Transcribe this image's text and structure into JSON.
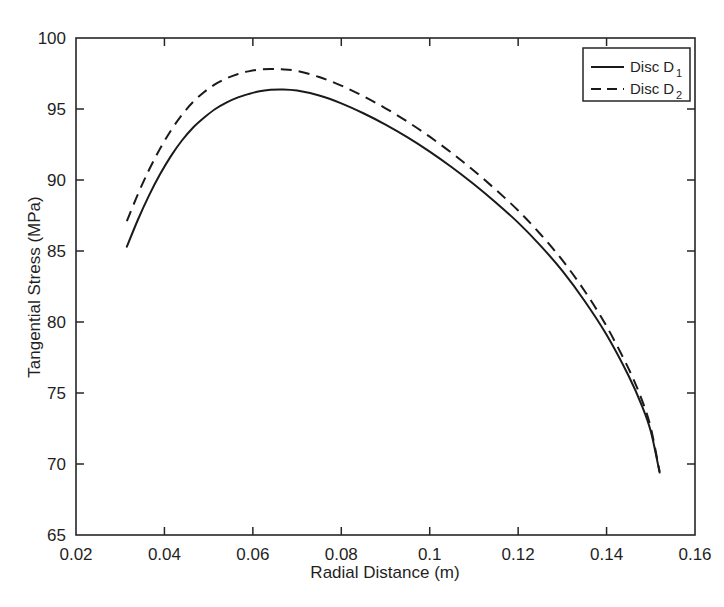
{
  "chart_data": {
    "type": "line",
    "title": "",
    "xlabel": "Radial Distance (m)",
    "ylabel": "Tangential Stress (MPa)",
    "xlim": [
      0.02,
      0.16
    ],
    "ylim": [
      65,
      100
    ],
    "xticks": [
      "0.02",
      "0.04",
      "0.06",
      "0.08",
      "0.1",
      "0.12",
      "0.14",
      "0.16"
    ],
    "xtick_values": [
      0.02,
      0.04,
      0.06,
      0.08,
      0.1,
      0.12,
      0.14,
      0.16
    ],
    "yticks": [
      "65",
      "70",
      "75",
      "80",
      "85",
      "90",
      "95",
      "100"
    ],
    "ytick_values": [
      65,
      70,
      75,
      80,
      85,
      90,
      95,
      100
    ],
    "grid": false,
    "legend_position": "top-right",
    "series": [
      {
        "name": "Disc D1",
        "label_base": "Disc D",
        "label_sub": "1",
        "style": "solid",
        "color": "#1a1a1a",
        "x": [
          0.0315,
          0.034,
          0.0365,
          0.039,
          0.0415,
          0.044,
          0.0465,
          0.049,
          0.0515,
          0.054,
          0.0565,
          0.059,
          0.0615,
          0.064,
          0.0665,
          0.07,
          0.075,
          0.08,
          0.085,
          0.09,
          0.095,
          0.1,
          0.105,
          0.11,
          0.115,
          0.12,
          0.125,
          0.13,
          0.135,
          0.14,
          0.145,
          0.148,
          0.15,
          0.152
        ],
        "y": [
          85.3,
          87.2,
          88.9,
          90.4,
          91.7,
          92.8,
          93.7,
          94.4,
          95.0,
          95.45,
          95.8,
          96.05,
          96.25,
          96.35,
          96.38,
          96.3,
          95.95,
          95.4,
          94.7,
          93.9,
          93.0,
          92.0,
          90.9,
          89.7,
          88.4,
          87.0,
          85.4,
          83.6,
          81.5,
          79.1,
          76.2,
          74.1,
          72.3,
          69.4
        ]
      },
      {
        "name": "Disc D2",
        "label_base": "Disc D",
        "label_sub": "2",
        "style": "dashed",
        "color": "#1a1a1a",
        "x": [
          0.0315,
          0.034,
          0.0365,
          0.039,
          0.0415,
          0.044,
          0.0465,
          0.049,
          0.0515,
          0.054,
          0.0565,
          0.059,
          0.0615,
          0.064,
          0.0665,
          0.07,
          0.075,
          0.08,
          0.085,
          0.09,
          0.095,
          0.1,
          0.105,
          0.11,
          0.115,
          0.12,
          0.125,
          0.13,
          0.135,
          0.14,
          0.145,
          0.148,
          0.15,
          0.152
        ],
        "y": [
          87.1,
          89.0,
          90.7,
          92.2,
          93.5,
          94.6,
          95.5,
          96.2,
          96.75,
          97.15,
          97.45,
          97.65,
          97.78,
          97.82,
          97.8,
          97.68,
          97.25,
          96.65,
          95.9,
          95.05,
          94.1,
          93.05,
          91.9,
          90.65,
          89.3,
          87.85,
          86.2,
          84.35,
          82.2,
          79.7,
          76.7,
          74.5,
          72.55,
          69.45
        ]
      }
    ]
  },
  "axes": {
    "x_title": "Radial Distance (m)",
    "y_title": "Tangential Stress (MPa)"
  },
  "legend": {
    "entries": [
      {
        "base": "Disc D",
        "sub": "1",
        "style": "solid"
      },
      {
        "base": "Disc D",
        "sub": "2",
        "style": "dashed"
      }
    ]
  }
}
